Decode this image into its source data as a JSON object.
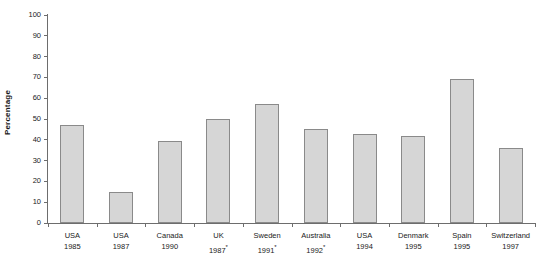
{
  "chart_data": {
    "type": "bar",
    "title": "",
    "subtitle": "",
    "xlabel": "",
    "ylabel": "Percentage",
    "ylim": [
      0,
      100
    ],
    "y_ticks": [
      0,
      10,
      20,
      30,
      40,
      50,
      60,
      70,
      80,
      90,
      100
    ],
    "grid": false,
    "legend": null,
    "bar_color": "#d6d6d6",
    "bar_border_color": "#8a8a8a",
    "axis_color": "#6d6d6d",
    "categories": [
      "USA 1985",
      "USA 1987",
      "Canada 1990",
      "UK 1987*",
      "Sweden 1991*",
      "Australia 1992*",
      "USA 1994",
      "Denmark 1995",
      "Spain 1995",
      "Switzerland 1997"
    ],
    "values": [
      47,
      15,
      39.5,
      50,
      57,
      45,
      43,
      42,
      69,
      36
    ],
    "points": [
      {
        "country": "USA",
        "year": "1985",
        "marker": "",
        "value": 47
      },
      {
        "country": "USA",
        "year": "1987",
        "marker": "",
        "value": 15
      },
      {
        "country": "Canada",
        "year": "1990",
        "marker": "",
        "value": 39.5
      },
      {
        "country": "UK",
        "year": "1987",
        "marker": "*",
        "value": 50
      },
      {
        "country": "Sweden",
        "year": "1991",
        "marker": "*",
        "value": 57
      },
      {
        "country": "Australia",
        "year": "1992",
        "marker": "*",
        "value": 45
      },
      {
        "country": "USA",
        "year": "1994",
        "marker": "",
        "value": 43
      },
      {
        "country": "Denmark",
        "year": "1995",
        "marker": "",
        "value": 42
      },
      {
        "country": "Spain",
        "year": "1995",
        "marker": "",
        "value": 69
      },
      {
        "country": "Switzerland",
        "year": "1997",
        "marker": "",
        "value": 36
      }
    ]
  }
}
